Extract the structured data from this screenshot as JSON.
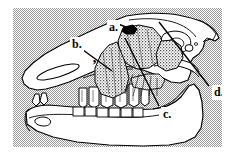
{
  "figure": {
    "background_color": "#9a9a9a",
    "line_color": "#000000",
    "paper_color": "#ffffff",
    "bone_fill": "#ffffff",
    "muscle_fill_tone": "#7a7a7a"
  },
  "labels": {
    "a": {
      "text": "a.",
      "name": "label-a",
      "note": "leader line points down-right to small solid black structure at top of muscle mass"
    },
    "b": {
      "text": "b.",
      "name": "label-b",
      "note": "leader line points down-right to stippled muscle over the maxilla"
    },
    "c": {
      "text": "c.",
      "name": "label-c",
      "note": "leader line points up-left to the lower border of the stippled muscle above the cheek teeth"
    },
    "d": {
      "text": "d.",
      "name": "label-d",
      "note": "leader line points up-left toward the back of the cranium"
    }
  },
  "marks": {
    "apostrophe": "’"
  },
  "anatomy": {
    "regions": [
      "cranium",
      "maxilla",
      "mandible",
      "nasal-opening",
      "orbit",
      "incisors",
      "upper-cheek-teeth",
      "lower-cheek-teeth",
      "auditory-meatus",
      "masseter-muscle",
      "temporalis-muscle"
    ]
  }
}
